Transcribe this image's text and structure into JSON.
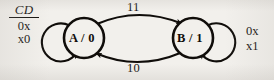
{
  "diagram": {
    "type": "state-transition-diagram",
    "title": "",
    "background_color": "#f2f0ec",
    "ink_color": "#100d0a",
    "input_label": {
      "numerator": "CD",
      "denominator_lines": [
        "0x",
        "x0"
      ],
      "has_fraction_rule": true
    },
    "states": [
      {
        "id": "A",
        "name": "A",
        "output": "0",
        "label": "A / 0",
        "cx": 84,
        "cy": 38,
        "r": 20
      },
      {
        "id": "B",
        "name": "B",
        "output": "1",
        "label": "B / 1",
        "cx": 193,
        "cy": 38,
        "r": 20
      }
    ],
    "transitions": [
      {
        "id": "a-to-b",
        "from": "A",
        "to": "B",
        "label": "11",
        "shape": "arc-top"
      },
      {
        "id": "b-to-a",
        "from": "B",
        "to": "A",
        "label": "10",
        "shape": "arc-bottom"
      },
      {
        "id": "a-self",
        "from": "A",
        "to": "A",
        "labels": [
          "0x",
          "x0"
        ],
        "shape": "self-loop-left"
      },
      {
        "id": "b-self",
        "from": "B",
        "to": "B",
        "labels": [
          "0x",
          "x1"
        ],
        "shape": "self-loop-right"
      }
    ],
    "self_loop_a_labels": [
      "0x",
      "x0"
    ],
    "self_loop_b_labels": [
      "0x",
      "x1"
    ]
  }
}
